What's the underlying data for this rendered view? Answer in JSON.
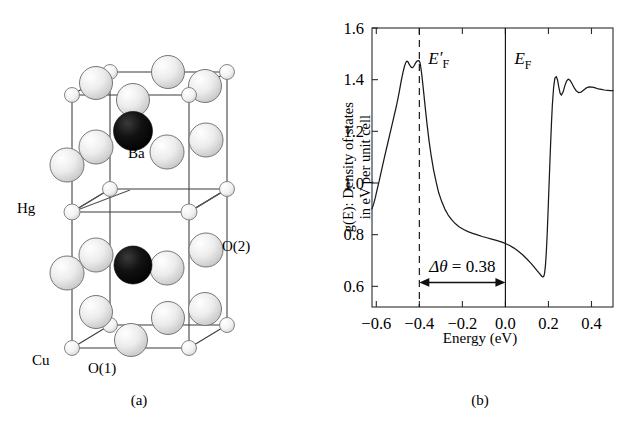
{
  "figure": {
    "panel_a": {
      "caption": "(a)",
      "atom_labels": [
        {
          "name": "Ba",
          "text": "Ba"
        },
        {
          "name": "Hg",
          "text": "Hg"
        },
        {
          "name": "O2",
          "text": "O(2)"
        },
        {
          "name": "Cu",
          "text": "Cu"
        },
        {
          "name": "O1",
          "text": "O(1)"
        }
      ],
      "colors": {
        "large_sphere": "#e8e8e8",
        "large_sphere_edge": "#6f6f6f",
        "dark_sphere": "#0a0a0a",
        "small_sphere": "#f0f0f0",
        "bond": "#555555",
        "cell_edge": "#333333"
      }
    },
    "panel_b": {
      "caption": "(b)",
      "ylabel_line1": "g(E): Density of states",
      "ylabel_line2": "in eV per unit cell",
      "xlabel": "Energy (eV)",
      "annotations": [
        {
          "name": "ef-prime",
          "text": "E′F",
          "base": "E",
          "prime": "′",
          "sub": "F",
          "energy": -0.4,
          "line": "dashed"
        },
        {
          "name": "ef",
          "text": "EF",
          "base": "E",
          "prime": "",
          "sub": "F",
          "energy": 0.0,
          "line": "solid"
        },
        {
          "name": "delta-theta",
          "text": "Δθ = 0.38",
          "symbol": "Δθ",
          "eq": " = ",
          "value": "0.38",
          "from": -0.4,
          "to": 0.0
        }
      ],
      "colors": {
        "axis": "#2b2b2b",
        "curve": "#1a1a1a",
        "marker": "#1a1a1a"
      }
    }
  },
  "chart_data": {
    "type": "line",
    "title": "",
    "xlabel": "Energy (eV)",
    "ylabel": "g(E): Density of states in eV per unit cell",
    "xlim": [
      -0.62,
      0.5
    ],
    "ylim": [
      0.52,
      1.6
    ],
    "xticks": [
      -0.6,
      -0.4,
      -0.2,
      0.0,
      0.2,
      0.4
    ],
    "xticklabels": [
      "−0.6",
      "−0.4",
      "−0.2",
      "0.0",
      "0.2",
      "0.4"
    ],
    "yticks": [
      0.6,
      0.8,
      1.0,
      1.2,
      1.4,
      1.6
    ],
    "yticklabels": [
      "0.6",
      "0.8",
      "1.0",
      "1.2",
      "1.4",
      "1.6"
    ],
    "grid": false,
    "legend": false,
    "series": [
      {
        "name": "density-of-states",
        "x": [
          -0.62,
          -0.612,
          -0.604,
          -0.596,
          -0.586,
          -0.575,
          -0.562,
          -0.548,
          -0.534,
          -0.52,
          -0.506,
          -0.494,
          -0.484,
          -0.476,
          -0.469,
          -0.463,
          -0.458,
          -0.452,
          -0.446,
          -0.44,
          -0.434,
          -0.428,
          -0.423,
          -0.418,
          -0.413,
          -0.408,
          -0.404,
          -0.4,
          -0.397,
          -0.394,
          -0.39,
          -0.385,
          -0.379,
          -0.372,
          -0.364,
          -0.355,
          -0.345,
          -0.334,
          -0.322,
          -0.31,
          -0.296,
          -0.282,
          -0.266,
          -0.25,
          -0.232,
          -0.214,
          -0.194,
          -0.174,
          -0.152,
          -0.13,
          -0.108,
          -0.086,
          -0.064,
          -0.042,
          -0.02,
          0.0,
          0.02,
          0.04,
          0.06,
          0.08,
          0.1,
          0.118,
          0.134,
          0.148,
          0.158,
          0.165,
          0.17,
          0.174,
          0.178,
          0.182,
          0.186,
          0.19,
          0.194,
          0.198,
          0.202,
          0.206,
          0.21,
          0.214,
          0.218,
          0.224,
          0.23,
          0.236,
          0.242,
          0.248,
          0.254,
          0.26,
          0.268,
          0.276,
          0.284,
          0.292,
          0.3,
          0.31,
          0.32,
          0.33,
          0.34,
          0.352,
          0.364,
          0.376,
          0.39,
          0.404,
          0.418,
          0.432,
          0.446,
          0.46,
          0.475,
          0.49,
          0.5
        ],
        "y": [
          0.9,
          0.92,
          0.945,
          0.975,
          1.01,
          1.052,
          1.1,
          1.15,
          1.2,
          1.25,
          1.3,
          1.35,
          1.396,
          1.428,
          1.452,
          1.466,
          1.472,
          1.468,
          1.458,
          1.45,
          1.446,
          1.449,
          1.456,
          1.464,
          1.47,
          1.473,
          1.474,
          1.472,
          1.466,
          1.452,
          1.428,
          1.392,
          1.344,
          1.288,
          1.226,
          1.164,
          1.106,
          1.052,
          1.004,
          0.962,
          0.928,
          0.9,
          0.876,
          0.858,
          0.842,
          0.83,
          0.82,
          0.812,
          0.805,
          0.799,
          0.793,
          0.788,
          0.783,
          0.778,
          0.772,
          0.766,
          0.758,
          0.748,
          0.736,
          0.722,
          0.706,
          0.69,
          0.674,
          0.66,
          0.65,
          0.643,
          0.638,
          0.636,
          0.638,
          0.65,
          0.68,
          0.73,
          0.8,
          0.885,
          0.975,
          1.065,
          1.15,
          1.23,
          1.3,
          1.37,
          1.406,
          1.412,
          1.4,
          1.372,
          1.348,
          1.34,
          1.352,
          1.376,
          1.394,
          1.402,
          1.398,
          1.384,
          1.368,
          1.356,
          1.35,
          1.352,
          1.36,
          1.368,
          1.372,
          1.371,
          1.368,
          1.364,
          1.362,
          1.36,
          1.359,
          1.358,
          1.358
        ]
      }
    ],
    "vlines": [
      {
        "name": "ef-prime-line",
        "x": -0.4,
        "style": "dashed",
        "label": "E′F"
      },
      {
        "name": "ef-line",
        "x": 0.0,
        "style": "solid",
        "label": "EF"
      }
    ],
    "annotations": [
      {
        "name": "delta-theta-arrow",
        "text": "Δθ = 0.38",
        "x_from": -0.4,
        "x_to": 0.0,
        "y": 0.615
      }
    ]
  }
}
